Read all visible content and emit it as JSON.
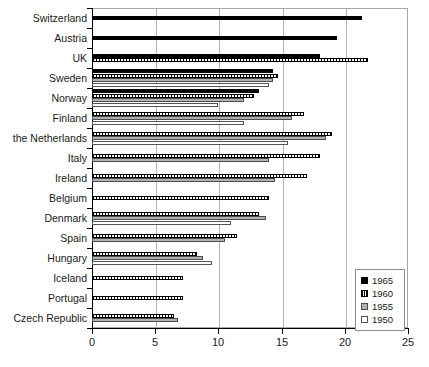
{
  "chart_data": {
    "type": "bar",
    "orientation": "horizontal",
    "title": "",
    "xlabel": "",
    "ylabel": "",
    "xlim": [
      0,
      25
    ],
    "xticks": [
      0,
      5,
      10,
      15,
      20,
      25
    ],
    "grid": true,
    "legend_position": "bottom-right",
    "categories": [
      "Switzerland",
      "Austria",
      "UK",
      "Sweden",
      "Norway",
      "Finland",
      "the Netherlands",
      "Italy",
      "Ireland",
      "Belgium",
      "Denmark",
      "Spain",
      "Hungary",
      "Iceland",
      "Portugal",
      "Czech Republic"
    ],
    "series": [
      {
        "name": "1965",
        "color": "#000000",
        "values": [
          21.4,
          19.4,
          18.0,
          14.3,
          13.2,
          null,
          null,
          null,
          null,
          null,
          null,
          null,
          null,
          null,
          null,
          null
        ]
      },
      {
        "name": "1960",
        "color": "#ffffff",
        "values": [
          null,
          null,
          21.8,
          14.7,
          12.8,
          16.8,
          19.0,
          18.0,
          17.0,
          14.0,
          13.2,
          11.5,
          8.3,
          7.2,
          7.2,
          6.5
        ]
      },
      {
        "name": "1955",
        "color": "#b0b0b0",
        "values": [
          null,
          null,
          null,
          14.3,
          12.0,
          15.8,
          18.5,
          14.0,
          14.5,
          null,
          13.8,
          10.5,
          8.8,
          null,
          null,
          6.8
        ]
      },
      {
        "name": "1950",
        "color": "#ffffff",
        "values": [
          null,
          null,
          null,
          14.0,
          10.0,
          12.0,
          15.5,
          null,
          null,
          null,
          11.0,
          null,
          9.5,
          null,
          null,
          null
        ]
      }
    ]
  },
  "legend": {
    "entries": [
      {
        "label": "1965",
        "swatch": "solid-black"
      },
      {
        "label": "1960",
        "swatch": "hatched"
      },
      {
        "label": "1955",
        "swatch": "gray"
      },
      {
        "label": "1950",
        "swatch": "white"
      }
    ]
  },
  "axis": {
    "x_tick_labels": [
      "0",
      "5",
      "10",
      "15",
      "20",
      "25"
    ]
  }
}
